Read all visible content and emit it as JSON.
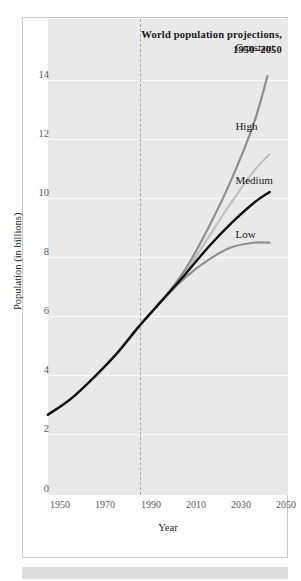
{
  "chart_data": {
    "type": "line",
    "title": "World population projections,",
    "title_line2": "1950–2050",
    "xlabel": "Year",
    "ylabel": "Population (in billions)",
    "xlim": [
      1950,
      2055
    ],
    "ylim": [
      0,
      15
    ],
    "xticks": [
      1950,
      1970,
      1990,
      2010,
      2030,
      2050
    ],
    "xtick_labels": [
      "1950",
      "1970",
      "1990",
      "2010",
      "2030",
      "2050"
    ],
    "yticks": [
      0,
      2,
      4,
      6,
      8,
      10,
      12,
      14
    ],
    "ytick_labels": [
      "0",
      "2",
      "4",
      "6",
      "8",
      "10",
      "12",
      "14"
    ],
    "grid": "horizontal-white",
    "legend_position": "inline-end-of-line",
    "annotation_vline_year": 2000,
    "annotation_vline_style": "dashed",
    "series": [
      {
        "name": "Constant",
        "color": "#8f8f8f",
        "label": "Constant",
        "label_x": 2032,
        "label_y": 14.1,
        "x": [
          1950,
          1960,
          1970,
          1980,
          1990,
          2000,
          2010,
          2020,
          2030,
          2040,
          2046
        ],
        "y": [
          2.53,
          3.03,
          3.7,
          4.45,
          5.33,
          6.14,
          7.1,
          8.4,
          9.9,
          11.7,
          13.2
        ]
      },
      {
        "name": "High",
        "color": "#c0c0c0",
        "label": "High",
        "label_x": 2032,
        "label_y": 11.6,
        "x": [
          1950,
          1960,
          1970,
          1980,
          1990,
          2000,
          2010,
          2020,
          2030,
          2040,
          2047
        ],
        "y": [
          2.53,
          3.03,
          3.7,
          4.45,
          5.33,
          6.14,
          7.0,
          8.1,
          9.2,
          10.2,
          10.75
        ]
      },
      {
        "name": "Medium",
        "color": "#111111",
        "label": "Medium",
        "label_x": 2032,
        "label_y": 9.9,
        "x": [
          1950,
          1960,
          1970,
          1980,
          1990,
          2000,
          2010,
          2020,
          2030,
          2040,
          2047
        ],
        "y": [
          2.53,
          3.03,
          3.7,
          4.45,
          5.33,
          6.14,
          6.95,
          7.8,
          8.55,
          9.2,
          9.55
        ]
      },
      {
        "name": "Low",
        "color": "#909090",
        "label": "Low",
        "label_x": 2032,
        "label_y": 8.2,
        "x": [
          1950,
          1960,
          1970,
          1980,
          1990,
          2000,
          2010,
          2020,
          2030,
          2040,
          2047
        ],
        "y": [
          2.53,
          3.03,
          3.7,
          4.45,
          5.33,
          6.14,
          6.85,
          7.4,
          7.8,
          7.95,
          7.95
        ]
      }
    ]
  },
  "colors": {
    "plot_background": "#e9e9e9",
    "gridline": "#fbfbfb",
    "card_border": "#c9c9c9",
    "footer_bar": "#dcdcdc",
    "tick_text": "#59595b",
    "axis_title_text": "#1d1d1d"
  }
}
